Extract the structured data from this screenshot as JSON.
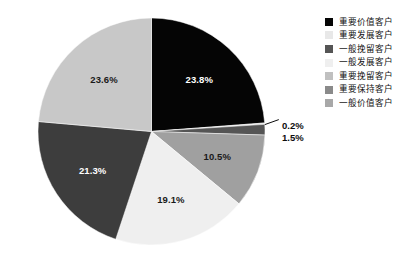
{
  "chart_data": {
    "type": "pie",
    "title": "",
    "subtitle": "",
    "xlabel": "",
    "ylabel": "",
    "grid": false,
    "legend_position": "right",
    "start_angle_deg": 0,
    "direction": "clockwise",
    "categories": [
      "重要价值客户",
      "重要发展客户",
      "一般挽留客户",
      "一般发展客户",
      "重要挽留客户",
      "重要保持客户",
      "一般价值客户"
    ],
    "values": [
      23.8,
      0.2,
      1.5,
      10.5,
      19.1,
      21.3,
      23.6
    ],
    "value_labels": [
      "23.8%",
      "0.2%",
      "1.5%",
      "10.5%",
      "19.1%",
      "21.3%",
      "23.6%"
    ],
    "colors": [
      "#050505",
      "#e8e8e8",
      "#555555",
      "#a0a0a0",
      "#efefef",
      "#3d3d3d",
      "#c8c8c8"
    ],
    "label_text_colors": [
      "#ffffff",
      "#0d0d0d",
      "#0d0d0d",
      "#1a1a1a",
      "#1a1a1a",
      "#ffffff",
      "#1a1a1a"
    ],
    "slices": [
      {
        "label": "重要价值客户",
        "value": 23.8,
        "value_label": "23.8%",
        "color": "#050505",
        "label_placement": "inside",
        "label_text_color": "#ffffff"
      },
      {
        "label": "重要发展客户",
        "value": 0.2,
        "value_label": "0.2%",
        "color": "#e8e8e8",
        "label_placement": "outside",
        "label_text_color": "#0d0d0d"
      },
      {
        "label": "一般挽留客户",
        "value": 1.5,
        "value_label": "1.5%",
        "color": "#555555",
        "label_placement": "outside",
        "label_text_color": "#0d0d0d"
      },
      {
        "label": "一般发展客户",
        "value": 10.5,
        "value_label": "10.5%",
        "color": "#a0a0a0",
        "label_placement": "inside",
        "label_text_color": "#1a1a1a"
      },
      {
        "label": "重要挽留客户",
        "value": 19.1,
        "value_label": "19.1%",
        "color": "#efefef",
        "label_placement": "inside",
        "label_text_color": "#1a1a1a"
      },
      {
        "label": "重要保持客户",
        "value": 21.3,
        "value_label": "21.3%",
        "color": "#3d3d3d",
        "label_placement": "inside",
        "label_text_color": "#ffffff"
      },
      {
        "label": "一般价值客户",
        "value": 23.6,
        "value_label": "23.6%",
        "color": "#c8c8c8",
        "label_placement": "inside",
        "label_text_color": "#1a1a1a"
      }
    ],
    "background_color": "#ffffff"
  },
  "legend": {
    "items": [
      {
        "label": "重要价值客户",
        "color": "#050505"
      },
      {
        "label": "重要发展客户",
        "color": "#e8e8e8"
      },
      {
        "label": "一般挽留客户",
        "color": "#555555"
      },
      {
        "label": "一般发展客户",
        "color": "#efefef"
      },
      {
        "label": "重要挽留客户",
        "color": "#c0c0c0"
      },
      {
        "label": "重要保持客户",
        "color": "#8a8a8a"
      },
      {
        "label": "一般价值客户",
        "color": "#a8a8a8"
      }
    ]
  },
  "callouts": [
    {
      "text": "0.2%",
      "left": 282,
      "top": 120
    },
    {
      "text": "1.5%",
      "left": 282,
      "top": 132
    }
  ],
  "geometry": {
    "center_x": 151.5,
    "center_y": 131.5,
    "radius": 113.5
  }
}
